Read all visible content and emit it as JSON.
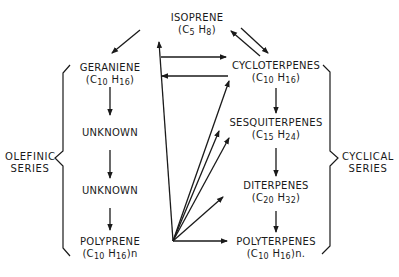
{
  "nodes": {
    "isoprene": {
      "name": "ISOPRENE",
      "f_pre": "(C",
      "f_a": "5",
      "f_mid": " H",
      "f_b": "8",
      "f_post": ")"
    },
    "geraniene": {
      "name": "GERANIENE",
      "f_pre": "(C",
      "f_a": "10",
      "f_mid": " H",
      "f_b": "16",
      "f_post": ")"
    },
    "unknown1": {
      "name": "UNKNOWN"
    },
    "unknown2": {
      "name": "UNKNOWN"
    },
    "polyprene": {
      "name": "POLYPRENE",
      "f_pre": "(C",
      "f_a": "10",
      "f_mid": " H",
      "f_b": "16",
      "f_post": ")n"
    },
    "cycloterpenes": {
      "name": "CYCLOTERPENES",
      "f_pre": "(C",
      "f_a": "10",
      "f_mid": " H",
      "f_b": "16",
      "f_post": ")"
    },
    "sesquiterpenes": {
      "name": "SESQUITERPENES",
      "f_pre": "(C",
      "f_a": "15",
      "f_mid": " H",
      "f_b": "24",
      "f_post": ")"
    },
    "diterpenes": {
      "name": "DITERPENES",
      "f_pre": "(C",
      "f_a": "20",
      "f_mid": " H",
      "f_b": "32",
      "f_post": ")"
    },
    "polyterpenes": {
      "name": "POLYTERPENES",
      "f_pre": "(C",
      "f_a": "10",
      "f_mid": " H",
      "f_b": "16",
      "f_post": ")n."
    }
  },
  "series": {
    "olefinic": {
      "line1": "OLEFINIC",
      "line2": "SERIES"
    },
    "cyclical": {
      "line1": "CYCLICAL",
      "line2": "SERIES"
    }
  },
  "colors": {
    "ink": "#1a1a1a",
    "background": "#ffffff"
  }
}
